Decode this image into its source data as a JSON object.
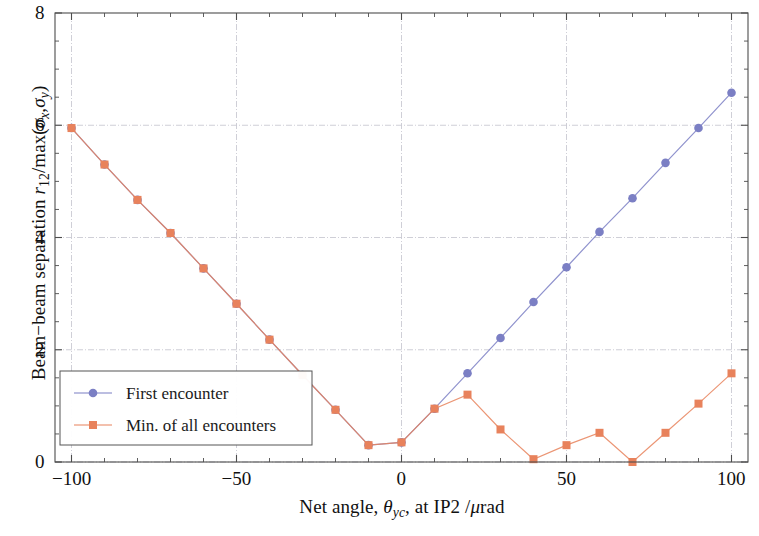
{
  "chart_data": {
    "type": "line",
    "title": "",
    "xlabel": "Net angle, θyc, at IP2 /μrad",
    "ylabel": "Beam−beam separation r12/max(σx,σy)",
    "xlim": [
      -105,
      105
    ],
    "ylim": [
      0,
      8
    ],
    "xticks": [
      -100,
      -50,
      0,
      50,
      100
    ],
    "xtick_labels": [
      "−100",
      "−50",
      "0",
      "50",
      "100"
    ],
    "yticks": [
      0,
      2,
      4,
      6,
      8
    ],
    "ytick_labels": [
      "0",
      "2",
      "4",
      "6",
      "8"
    ],
    "xminor_step": 10,
    "yminor_step": 0.5,
    "grid": true,
    "legend_position": "lower left",
    "x": [
      -100,
      -90,
      -80,
      -70,
      -60,
      -50,
      -40,
      -30,
      -20,
      -10,
      0,
      10,
      20,
      30,
      40,
      50,
      60,
      70,
      80,
      90,
      100
    ],
    "series": [
      {
        "name": "First encounter",
        "color": "#7b7fc4",
        "marker": "circle",
        "values": [
          5.95,
          5.3,
          4.67,
          4.08,
          3.45,
          2.82,
          2.18,
          1.55,
          0.93,
          0.3,
          0.35,
          0.95,
          1.58,
          2.21,
          2.85,
          3.47,
          4.1,
          4.7,
          5.33,
          5.95,
          6.58
        ]
      },
      {
        "name": "Min. of all encounters",
        "color": "#e8825c",
        "marker": "square",
        "values": [
          5.95,
          5.3,
          4.67,
          4.08,
          3.45,
          2.82,
          2.18,
          1.55,
          0.93,
          0.3,
          0.35,
          0.95,
          1.2,
          0.58,
          0.05,
          0.3,
          0.52,
          0.0,
          0.52,
          1.04,
          1.58
        ]
      }
    ],
    "legend": [
      {
        "label": "First encounter",
        "color": "#7b7fc4",
        "marker": "circle"
      },
      {
        "label": "Min. of all encounters",
        "color": "#e8825c",
        "marker": "square"
      }
    ]
  },
  "labels": {
    "ylabel_parts": {
      "lead": "Beam−beam separation ",
      "r": "r",
      "r_sub": "12",
      "slash_max": "/max(",
      "sigma_x": "σ",
      "sigma_x_sub": "x",
      "comma": ",",
      "sigma_y": "σ",
      "sigma_y_sub": "y",
      "close": ")"
    },
    "xlabel_parts": {
      "lead": "Net angle, ",
      "theta": "θ",
      "theta_sub": "yc",
      "tail": ",  at IP2 /",
      "mu": "μ",
      "rad": "rad"
    }
  }
}
